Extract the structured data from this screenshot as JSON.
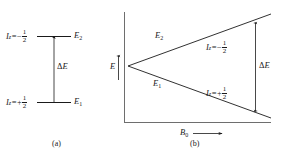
{
  "figure": {
    "line_color": "#1a1a1a",
    "background": "#ffffff"
  },
  "panel_a": {
    "caption": "(a)",
    "upper_level": {
      "spin_symbol": "I",
      "spin_subscript": "z",
      "equals": "=",
      "sign": "−",
      "fraction_numerator": "1",
      "fraction_denominator": "2",
      "energy_symbol": "E",
      "energy_subscript": "2"
    },
    "lower_level": {
      "spin_symbol": "I",
      "spin_subscript": "z",
      "equals": "=",
      "sign": "+",
      "fraction_numerator": "1",
      "fraction_denominator": "2",
      "energy_symbol": "E",
      "energy_subscript": "1"
    },
    "gap_label": {
      "delta": "Δ",
      "symbol": "E"
    }
  },
  "panel_b": {
    "caption": "(b)",
    "y_axis_label": "E",
    "x_axis_label": "B",
    "x_axis_subscript": "0",
    "upper_branch_label": {
      "symbol": "E",
      "subscript": "2"
    },
    "lower_branch_label": {
      "symbol": "E",
      "subscript": "1"
    },
    "upper_spin": {
      "spin_symbol": "I",
      "spin_subscript": "z",
      "equals": "=",
      "sign": "−",
      "fraction_numerator": "1",
      "fraction_denominator": "2"
    },
    "lower_spin": {
      "spin_symbol": "I",
      "spin_subscript": "z",
      "equals": "=",
      "sign": "+",
      "fraction_numerator": "1",
      "fraction_denominator": "2"
    },
    "gap_label": {
      "delta": "Δ",
      "symbol": "E"
    }
  }
}
